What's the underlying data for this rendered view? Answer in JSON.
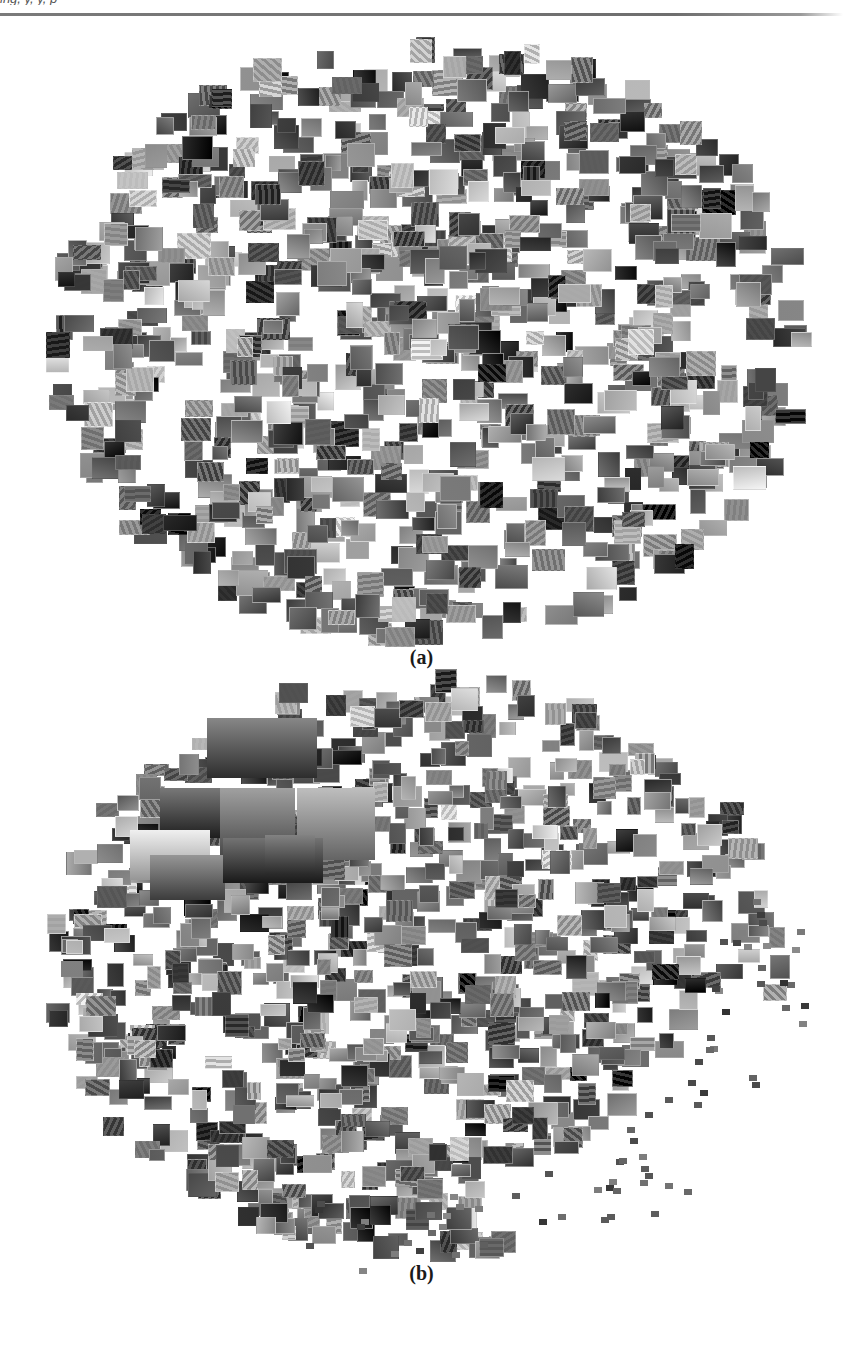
{
  "page": {
    "header_text": "ing, y, y, p",
    "header_rule_color": "#6e6e6e",
    "background": "#ffffff"
  },
  "figure": {
    "panels": [
      {
        "id": "a",
        "label": "(a)",
        "label_top": 646,
        "mosaic": {
          "center_x": 428,
          "center_y": 340,
          "radius_x": 378,
          "radius_y": 300,
          "tile_count": 900,
          "tile_w_range": [
            16,
            34
          ],
          "tile_h_range": [
            14,
            26
          ],
          "large_tiles": [],
          "seed": 17
        }
      },
      {
        "id": "b",
        "label": "(b)",
        "label_top": 1262,
        "mosaic": {
          "center_x": 420,
          "center_y": 965,
          "radius_x": 370,
          "radius_y": 290,
          "tile_count": 950,
          "tile_w_range": [
            14,
            30
          ],
          "tile_h_range": [
            12,
            24
          ],
          "sparse_tail": {
            "count": 70,
            "from_angle_deg": -20,
            "to_angle_deg": 110,
            "tile_size": 8
          },
          "large_tiles": [
            {
              "x": 207,
              "y": 718,
              "w": 110,
              "h": 60,
              "tone": 95
            },
            {
              "x": 160,
              "y": 788,
              "w": 60,
              "h": 50,
              "tone": 80
            },
            {
              "x": 220,
              "y": 788,
              "w": 75,
              "h": 70,
              "tone": 120
            },
            {
              "x": 297,
              "y": 788,
              "w": 78,
              "h": 72,
              "tone": 150
            },
            {
              "x": 130,
              "y": 830,
              "w": 80,
              "h": 50,
              "tone": 200
            },
            {
              "x": 150,
              "y": 855,
              "w": 75,
              "h": 45,
              "tone": 110
            },
            {
              "x": 223,
              "y": 838,
              "w": 100,
              "h": 45,
              "tone": 75
            },
            {
              "x": 265,
              "y": 835,
              "w": 50,
              "h": 40,
              "tone": 90
            }
          ],
          "seed": 91
        }
      }
    ]
  }
}
